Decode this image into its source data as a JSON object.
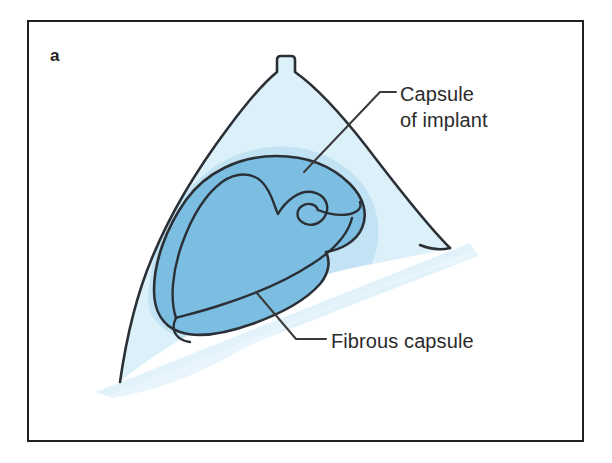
{
  "figure": {
    "panel_letter": "a",
    "frame_color": "#231f20",
    "background_color": "#ffffff"
  },
  "illustration": {
    "name": "breast-implant-cross-section",
    "colors": {
      "breast_tissue_pale": "#dcf0fa",
      "breast_tissue_mid": "#bfe2f2",
      "implant_fill": "#7cbee2",
      "outline": "#2b2f36",
      "chest_wall_wedge": "#e2f2fa"
    },
    "parts": [
      {
        "name": "breast-outline",
        "label": ""
      },
      {
        "name": "nipple",
        "label": ""
      },
      {
        "name": "implant-body",
        "label": ""
      },
      {
        "name": "fibrous-capsule-line",
        "label": ""
      },
      {
        "name": "chest-wall-wedge",
        "label": ""
      }
    ]
  },
  "callouts": [
    {
      "id": "capsule-of-implant",
      "text": "Capsule\nof implant",
      "line1": "Capsule",
      "line2": "of implant"
    },
    {
      "id": "fibrous-capsule",
      "text": "Fibrous capsule"
    }
  ]
}
